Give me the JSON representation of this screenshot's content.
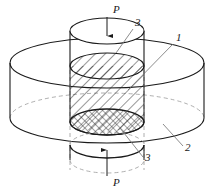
{
  "figure": {
    "background_color": "#ffffff",
    "line_color": "#1a1a1a",
    "hidden_line_color": "#8a8a8a",
    "hatch_color": "#1a1a1a"
  },
  "labels": [
    {
      "id": "load-top",
      "text": "P",
      "x": 113,
      "y": 13,
      "style": "italic"
    },
    {
      "id": "callout-3-top",
      "text": "3",
      "x": 135,
      "y": 26,
      "style": "italic"
    },
    {
      "id": "callout-1",
      "text": "1",
      "x": 176,
      "y": 41,
      "style": "italic"
    },
    {
      "id": "callout-2",
      "text": "2",
      "x": 185,
      "y": 151,
      "style": "italic"
    },
    {
      "id": "callout-3-bottom",
      "text": "3",
      "x": 145,
      "y": 161,
      "style": "italic"
    },
    {
      "id": "load-bottom",
      "text": "P",
      "x": 113,
      "y": 186,
      "style": "italic"
    }
  ],
  "parts": [
    {
      "number": "1",
      "name": "specimen-core",
      "description": "hatched inner cylindrical specimen"
    },
    {
      "number": "2",
      "name": "containment-disk",
      "description": "large outer disk / confining ring"
    },
    {
      "number": "3",
      "name": "loading-platen",
      "description": "upper and lower loading platens"
    }
  ],
  "loads": [
    {
      "name": "top-load",
      "label": "P",
      "direction": "down"
    },
    {
      "name": "bottom-load",
      "label": "P",
      "direction": "up"
    }
  ],
  "geometry": {
    "outer_disk": {
      "cx": 107,
      "rx": 97,
      "ry": 25,
      "top_y": 63,
      "bottom_y": 118
    },
    "inner_cylinder": {
      "cx": 107,
      "rx": 37,
      "ry": 13,
      "top_y": 66,
      "bottom_y": 122
    },
    "upper_platen": {
      "cx": 107,
      "rx": 37,
      "ry": 13,
      "top_y": 31,
      "bottom_y": 66
    },
    "lower_platen": {
      "cx": 107,
      "rx": 37,
      "ry": 13,
      "top_y": 122,
      "bottom_y": 158
    }
  }
}
